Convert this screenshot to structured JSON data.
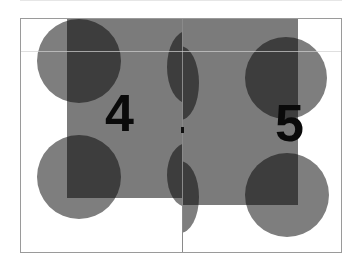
{
  "spread": {
    "pages": [
      {
        "side": "left",
        "number": "4"
      },
      {
        "side": "right",
        "number": "5"
      }
    ]
  },
  "colors": {
    "background": "#ffffff",
    "shape_gray": "#7e7e7e",
    "overlap_dark": "#3a3a3a",
    "number": "#0a0a0a",
    "frame": "#9a9a9a"
  }
}
